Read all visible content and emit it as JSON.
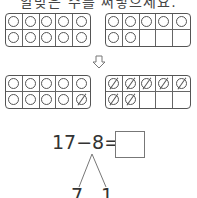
{
  "instruction": "알맞은 수를 써넣으세요.",
  "top_frames": [
    {
      "name": "ten-frame-top-left",
      "filled": 10,
      "crossed": 0
    },
    {
      "name": "ten-frame-top-right",
      "filled": 7,
      "crossed": 0
    }
  ],
  "arrow_icon": "down-arrow-icon",
  "bottom_frames": [
    {
      "name": "ten-frame-bottom-left",
      "filled": 10,
      "crossed": 1
    },
    {
      "name": "ten-frame-bottom-right",
      "filled": 7,
      "crossed": 7
    }
  ],
  "equation": {
    "minuend": "17",
    "operator": "−",
    "subtrahend": "8",
    "equals": "=",
    "answer": ""
  },
  "decomposition": {
    "left": "7",
    "right": "1"
  }
}
